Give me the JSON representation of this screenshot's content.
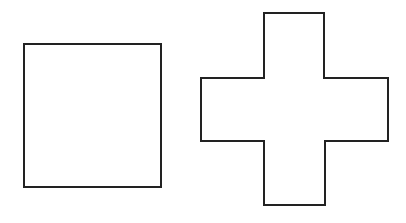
{
  "canvas": {
    "width": 406,
    "height": 223,
    "background": "#ffffff"
  },
  "style": {
    "stroke": "#222222",
    "stroke_width": 2,
    "fill": "#ffffff"
  },
  "shapes": [
    {
      "name": "square",
      "type": "rect",
      "x": 24,
      "y": 44,
      "width": 137,
      "height": 143
    },
    {
      "name": "cross",
      "type": "polygon",
      "points": [
        [
          264,
          13
        ],
        [
          324,
          13
        ],
        [
          324,
          78
        ],
        [
          388,
          78
        ],
        [
          388,
          141
        ],
        [
          325,
          141
        ],
        [
          325,
          205
        ],
        [
          264,
          205
        ],
        [
          264,
          141
        ],
        [
          201,
          141
        ],
        [
          201,
          78
        ],
        [
          264,
          78
        ]
      ]
    }
  ]
}
